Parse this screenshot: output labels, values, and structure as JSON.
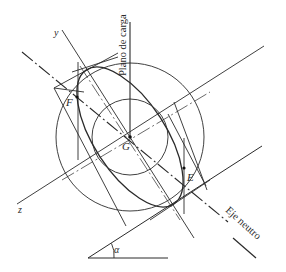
{
  "diagram": {
    "title": "",
    "labels": {
      "load_plane": "Plano de carga",
      "neutral_axis": "Eje neutro",
      "y_axis": "y",
      "z_axis": "z",
      "centroid": "G",
      "point_f": "F",
      "point_e": "E",
      "angle": "α"
    },
    "colors": {
      "stroke": "#2a2a2a",
      "background": "#ffffff"
    },
    "elements": [
      "large-circle",
      "small-circle",
      "inertia-ellipse",
      "load-plane-line",
      "y-axis",
      "z-axis",
      "neutral-axis",
      "conjugate-diameter",
      "tangent-lines",
      "angle-alpha"
    ]
  }
}
